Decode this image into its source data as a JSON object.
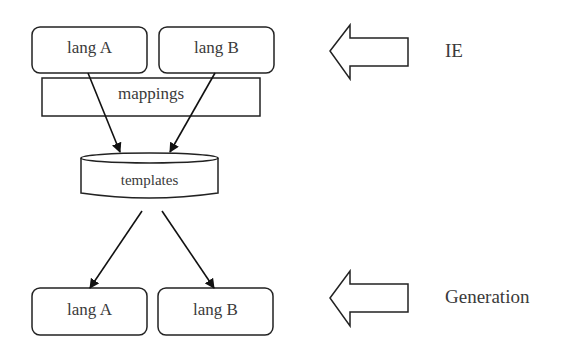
{
  "diagram": {
    "top_row": [
      {
        "label": "lang A"
      },
      {
        "label": "lang B"
      }
    ],
    "mappings_label": "mappings",
    "templates_label": "templates",
    "bottom_row": [
      {
        "label": "lang A"
      },
      {
        "label": "lang B"
      }
    ],
    "side_labels": {
      "ie": "IE",
      "generation": "Generation"
    },
    "colors": {
      "stroke": "#222222",
      "background": "#ffffff",
      "text": "#3a3a3a"
    }
  }
}
